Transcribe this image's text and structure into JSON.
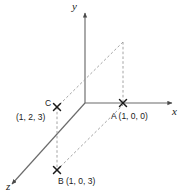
{
  "diagram": {
    "axes": [
      {
        "name": "x-axis",
        "label": "x",
        "direction": "right"
      },
      {
        "name": "y-axis",
        "label": "y",
        "direction": "up"
      },
      {
        "name": "z-axis",
        "label": "z",
        "direction": "down-left"
      }
    ],
    "points": [
      {
        "id": "A",
        "marker": "x-marker",
        "label": "A (1, 0, 0)",
        "coords": [
          1,
          0,
          0
        ]
      },
      {
        "id": "B",
        "marker": "x-marker",
        "label": "B (1, 0, 3)",
        "coords": [
          1,
          0,
          3
        ]
      },
      {
        "id": "C",
        "marker": "x-marker",
        "label": "C",
        "coords_label": "(1, 2, 3)",
        "coords": [
          1,
          2,
          3
        ]
      }
    ],
    "colors": {
      "axis": "#6b6b6b",
      "dashed": "#8c8c8c",
      "text": "#1a1a1a",
      "marker": "#1a1a1a",
      "background": "#ffffff"
    }
  }
}
